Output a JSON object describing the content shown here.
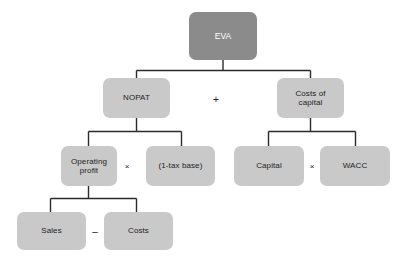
{
  "diagram": {
    "colors": {
      "root_fill": "#8b8b8b",
      "root_text": "#ffffff",
      "node_fill": "#c9c9c9",
      "node_text": "#1d1d1d",
      "connector": "#2b2b2b",
      "background": "#ffffff"
    },
    "nodes": {
      "eva": "EVA",
      "nopat": "NOPAT",
      "costs_of_capital": "Costs of\ncapital",
      "operating_profit": "Operating\nprofit",
      "one_minus_tax_base": "(1-tax base)",
      "capital": "Capital",
      "wacc": "WACC",
      "sales": "Sales",
      "costs": "Costs"
    },
    "operators": {
      "plus": "+",
      "times_nopat": "×",
      "times_capital": "×",
      "minus": "–"
    }
  }
}
